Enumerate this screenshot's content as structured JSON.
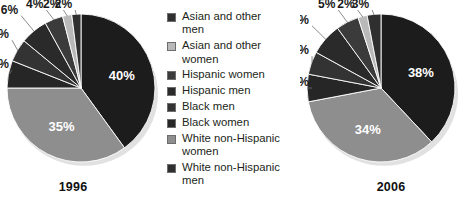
{
  "chart_data": [
    {
      "type": "pie",
      "title": "1996",
      "categories": [
        "Asian and other men",
        "Asian and other women",
        "Hispanic women",
        "Hispanic men",
        "Black men",
        "Black women",
        "White non-Hispanic women",
        "White non-Hispanic men"
      ],
      "values": [
        2,
        2,
        4,
        6,
        5,
        6,
        35,
        40
      ],
      "labels": [
        "2%",
        "2%",
        "4%",
        "6%",
        "5%",
        "6%",
        "35%",
        "40%"
      ],
      "colors": [
        "#2f2f2f",
        "#b9b9b9",
        "#3b3b3b",
        "#2a2a2a",
        "#333333",
        "#262626",
        "#8e8e8e",
        "#1c1c1c"
      ],
      "legend_position": "center",
      "grid": false
    },
    {
      "type": "pie",
      "title": "2006",
      "categories": [
        "Asian and other men",
        "Asian and other women",
        "Hispanic women",
        "Hispanic men",
        "Black men",
        "Black women",
        "White non-Hispanic women",
        "White non-Hispanic men"
      ],
      "values": [
        3,
        2,
        5,
        7,
        5,
        6,
        34,
        38
      ],
      "labels": [
        "3%",
        "2%",
        "5%",
        "7%",
        "5%",
        "6%",
        "34%",
        "38%"
      ],
      "colors": [
        "#2f2f2f",
        "#b9b9b9",
        "#3b3b3b",
        "#2a2a2a",
        "#333333",
        "#262626",
        "#8e8e8e",
        "#1c1c1c"
      ],
      "legend_position": "center",
      "grid": false
    }
  ],
  "charts": {
    "left": {
      "year": "1996",
      "slices": [
        {
          "label": "40%",
          "value": 40,
          "color": "#1c1c1c",
          "category": "White non-Hispanic men",
          "inside": true
        },
        {
          "label": "35%",
          "value": 35,
          "color": "#8e8e8e",
          "category": "White non-Hispanic women",
          "inside": true
        },
        {
          "label": "6%",
          "value": 6,
          "color": "#262626",
          "category": "Black women",
          "inside": false
        },
        {
          "label": "5%",
          "value": 5,
          "color": "#333333",
          "category": "Black men",
          "inside": false
        },
        {
          "label": "6%",
          "value": 6,
          "color": "#2a2a2a",
          "category": "Hispanic men",
          "inside": false
        },
        {
          "label": "4%",
          "value": 4,
          "color": "#3b3b3b",
          "category": "Hispanic women",
          "inside": false
        },
        {
          "label": "2%",
          "value": 2,
          "color": "#b9b9b9",
          "category": "Asian and other women",
          "inside": false
        },
        {
          "label": "2%",
          "value": 2,
          "color": "#2f2f2f",
          "category": "Asian and other men",
          "inside": false
        }
      ]
    },
    "right": {
      "year": "2006",
      "slices": [
        {
          "label": "38%",
          "value": 38,
          "color": "#1c1c1c",
          "category": "White non-Hispanic men",
          "inside": true
        },
        {
          "label": "34%",
          "value": 34,
          "color": "#8e8e8e",
          "category": "White non-Hispanic women",
          "inside": true
        },
        {
          "label": "6%",
          "value": 6,
          "color": "#262626",
          "category": "Black women",
          "inside": false
        },
        {
          "label": "5%",
          "value": 5,
          "color": "#333333",
          "category": "Black men",
          "inside": false
        },
        {
          "label": "7%",
          "value": 7,
          "color": "#2a2a2a",
          "category": "Hispanic men",
          "inside": false
        },
        {
          "label": "5%",
          "value": 5,
          "color": "#3b3b3b",
          "category": "Hispanic women",
          "inside": false
        },
        {
          "label": "2%",
          "value": 2,
          "color": "#b9b9b9",
          "category": "Asian and other women",
          "inside": false
        },
        {
          "label": "3%",
          "value": 3,
          "color": "#2f2f2f",
          "category": "Asian and other men",
          "inside": false
        }
      ]
    }
  },
  "legend": {
    "items": [
      {
        "label": "Asian and other\nmen",
        "color": "#2f2f2f"
      },
      {
        "label": "Asian and other\nwomen",
        "color": "#b9b9b9"
      },
      {
        "label": "Hispanic women",
        "color": "#3b3b3b"
      },
      {
        "label": "Hispanic men",
        "color": "#2a2a2a"
      },
      {
        "label": "Black men",
        "color": "#333333"
      },
      {
        "label": "Black women",
        "color": "#262626"
      },
      {
        "label": "White non-Hispanic\nwomen",
        "color": "#8e8e8e"
      },
      {
        "label": "White non-Hispanic\nmen",
        "color": "#2f2f2f"
      }
    ]
  }
}
